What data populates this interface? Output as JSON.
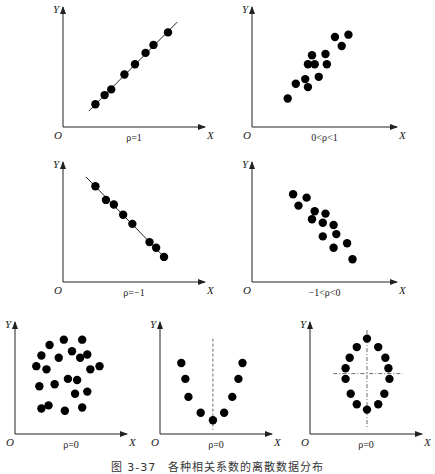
{
  "figure": {
    "caption": "图 3-37　各种相关系数的离散数据分布",
    "axis_labels": {
      "x": "X",
      "y": "Y",
      "origin": "O"
    }
  },
  "chart_data": [
    {
      "type": "scatter",
      "panel": "top-left",
      "title": "ρ=1",
      "xlabel": "X",
      "ylabel": "Y",
      "fit_line": "solid, positive slope",
      "points": [
        [
          20,
          20
        ],
        [
          27,
          28
        ],
        [
          32,
          33
        ],
        [
          42,
          46
        ],
        [
          50,
          55
        ],
        [
          58,
          65
        ],
        [
          64,
          72
        ],
        [
          75,
          83
        ]
      ],
      "xlim": [
        0,
        100
      ],
      "ylim": [
        0,
        100
      ]
    },
    {
      "type": "scatter",
      "panel": "top-right",
      "title": "0<ρ<1",
      "xlabel": "X",
      "ylabel": "Y",
      "points": [
        [
          22,
          25
        ],
        [
          28,
          38
        ],
        [
          35,
          42
        ],
        [
          37,
          35
        ],
        [
          37,
          55
        ],
        [
          40,
          63
        ],
        [
          42,
          55
        ],
        [
          45,
          44
        ],
        [
          50,
          64
        ],
        [
          51,
          55
        ],
        [
          57,
          79
        ],
        [
          62,
          71
        ],
        [
          67,
          81
        ]
      ],
      "xlim": [
        0,
        100
      ],
      "ylim": [
        0,
        100
      ]
    },
    {
      "type": "scatter",
      "panel": "middle-left",
      "title": "ρ=−1",
      "xlabel": "X",
      "ylabel": "Y",
      "fit_line": "solid, negative slope",
      "points": [
        [
          20,
          84
        ],
        [
          28,
          72
        ],
        [
          34,
          68
        ],
        [
          41,
          59
        ],
        [
          48,
          51
        ],
        [
          61,
          35
        ],
        [
          66,
          30
        ],
        [
          72,
          22
        ]
      ],
      "xlim": [
        0,
        100
      ],
      "ylim": [
        0,
        100
      ]
    },
    {
      "type": "scatter",
      "panel": "middle-right",
      "title": "−1<ρ<0",
      "xlabel": "X",
      "ylabel": "Y",
      "points": [
        [
          26,
          77
        ],
        [
          30,
          67
        ],
        [
          36,
          74
        ],
        [
          42,
          62
        ],
        [
          40,
          55
        ],
        [
          50,
          60
        ],
        [
          48,
          52
        ],
        [
          56,
          50
        ],
        [
          48,
          40
        ],
        [
          58,
          42
        ],
        [
          56,
          30
        ],
        [
          66,
          34
        ],
        [
          70,
          20
        ]
      ],
      "xlim": [
        0,
        100
      ],
      "ylim": [
        0,
        100
      ]
    },
    {
      "type": "scatter",
      "panel": "bottom-left",
      "title": "ρ=0",
      "xlabel": "X",
      "ylabel": "Y",
      "pattern": "random cloud",
      "points": [
        [
          28,
          84
        ],
        [
          42,
          89
        ],
        [
          60,
          89
        ],
        [
          20,
          74
        ],
        [
          37,
          72
        ],
        [
          50,
          78
        ],
        [
          58,
          72
        ],
        [
          65,
          75
        ],
        [
          15,
          64
        ],
        [
          25,
          61
        ],
        [
          68,
          61
        ],
        [
          77,
          64
        ],
        [
          46,
          52
        ],
        [
          55,
          51
        ],
        [
          18,
          45
        ],
        [
          33,
          47
        ],
        [
          65,
          40
        ],
        [
          53,
          38
        ],
        [
          20,
          24
        ],
        [
          27,
          27
        ],
        [
          43,
          22
        ],
        [
          60,
          25
        ]
      ],
      "xlim": [
        0,
        100
      ],
      "ylim": [
        0,
        100
      ]
    },
    {
      "type": "scatter",
      "panel": "bottom-middle",
      "title": "ρ=0",
      "xlabel": "X",
      "ylabel": "Y",
      "pattern": "parabola (U-shape) with dashed vertical axis of symmetry",
      "points": [
        [
          15,
          67
        ],
        [
          19,
          52
        ],
        [
          22,
          35
        ],
        [
          34,
          20
        ],
        [
          46,
          13
        ],
        [
          57,
          20
        ],
        [
          65,
          35
        ],
        [
          71,
          52
        ],
        [
          75,
          67
        ]
      ],
      "xlim": [
        0,
        100
      ],
      "ylim": [
        0,
        100
      ]
    },
    {
      "type": "scatter",
      "panel": "bottom-right",
      "title": "ρ=0",
      "xlabel": "X",
      "ylabel": "Y",
      "pattern": "ellipse with dashed crosshair through center",
      "points": [
        [
          50,
          90
        ],
        [
          40,
          82
        ],
        [
          61,
          82
        ],
        [
          33,
          72
        ],
        [
          68,
          72
        ],
        [
          29,
          62
        ],
        [
          71,
          62
        ],
        [
          29,
          52
        ],
        [
          72,
          52
        ],
        [
          34,
          38
        ],
        [
          67,
          38
        ],
        [
          40,
          28
        ],
        [
          61,
          28
        ],
        [
          50,
          23
        ]
      ],
      "xlim": [
        0,
        100
      ],
      "ylim": [
        0,
        100
      ]
    }
  ]
}
